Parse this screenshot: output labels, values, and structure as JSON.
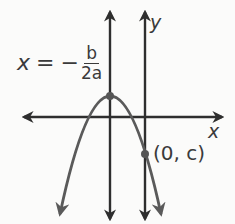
{
  "figure": {
    "colors": {
      "axes": "#2e2e2e",
      "parabola": "#5a5a5a",
      "text": "#3a3a3a",
      "background": "#fbfbfa"
    }
  },
  "labels": {
    "axis_equation": {
      "lhs": "x",
      "equals": "=",
      "minus": "−",
      "numerator": "b",
      "denominator": "2a"
    },
    "x_axis": "x",
    "y_axis": "y",
    "y_intercept": "(0, c)"
  },
  "elements": {
    "x_axis_line": {
      "y": 117,
      "x_start": 20,
      "x_end": 226
    },
    "y_axis_line": {
      "x": 145,
      "y_start": 8,
      "y_end": 222
    },
    "axis_of_symmetry_line": {
      "x": 110,
      "y_start": 8,
      "y_end": 222
    },
    "vertex_point": {
      "x": 110,
      "y": 96
    },
    "y_intercept_point": {
      "x": 145,
      "y": 154
    },
    "parabola_endpoints": {
      "left": {
        "x": 58,
        "y": 222
      },
      "right": {
        "x": 163,
        "y": 222
      }
    }
  }
}
